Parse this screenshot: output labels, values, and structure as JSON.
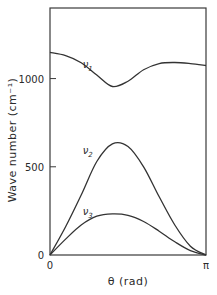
{
  "chart_data": {
    "type": "line",
    "title": "",
    "xlabel": "θ (rad)",
    "ylabel": "Wave number (cm⁻¹)",
    "xlim": [
      0,
      3.14159
    ],
    "ylim": [
      0,
      1400
    ],
    "grid": false,
    "legend": "inline labels",
    "x_ticks": [
      {
        "value": 0,
        "label": "0"
      },
      {
        "value": 3.14159,
        "label": "π"
      }
    ],
    "y_ticks": [
      {
        "value": 0,
        "label": "0"
      },
      {
        "value": 500,
        "label": "500"
      },
      {
        "value": 1000,
        "label": "1000"
      }
    ],
    "x_fraction_of_pi": [
      0,
      0.1,
      0.2,
      0.3,
      0.4,
      0.5,
      0.6,
      0.7,
      0.8,
      0.9,
      1.0
    ],
    "series": [
      {
        "name": "ν1",
        "label_main": "ν",
        "label_sub": "1",
        "values": [
          1148,
          1130,
          1090,
          1020,
          955,
          985,
          1050,
          1085,
          1091,
          1085,
          1074
        ],
        "label_pos": {
          "x": 0.21,
          "y": 1060
        }
      },
      {
        "name": "ν2",
        "label_main": "ν",
        "label_sub": "2",
        "values": [
          0,
          160,
          340,
          530,
          630,
          615,
          500,
          330,
          170,
          50,
          0
        ],
        "label_pos": {
          "x": 0.21,
          "y": 575
        }
      },
      {
        "name": "ν3",
        "label_main": "ν",
        "label_sub": "3",
        "values": [
          0,
          90,
          170,
          220,
          233,
          225,
          190,
          135,
          75,
          25,
          0
        ],
        "label_pos": {
          "x": 0.21,
          "y": 228
        }
      }
    ]
  }
}
